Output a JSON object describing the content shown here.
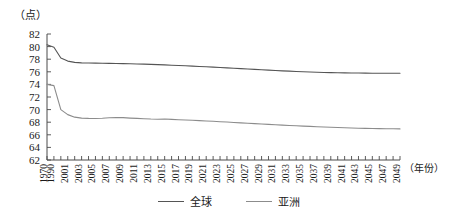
{
  "chart_data": {
    "type": "line",
    "title": "",
    "xlabel": "（年份）",
    "ylabel": "（点）",
    "ylim": [
      62,
      82
    ],
    "ytick_step": 2,
    "yticks": [
      62,
      64,
      66,
      68,
      70,
      72,
      74,
      76,
      78,
      80,
      82
    ],
    "grid": false,
    "legend_position": "bottom-center",
    "x": [
      1970,
      1990,
      2000,
      2001,
      2002,
      2003,
      2004,
      2005,
      2006,
      2007,
      2008,
      2009,
      2010,
      2011,
      2012,
      2013,
      2014,
      2015,
      2016,
      2017,
      2018,
      2019,
      2020,
      2021,
      2022,
      2023,
      2024,
      2025,
      2026,
      2027,
      2028,
      2029,
      2030,
      2031,
      2032,
      2033,
      2034,
      2035,
      2036,
      2037,
      2038,
      2039,
      2040,
      2041,
      2042,
      2043,
      2044,
      2045,
      2046,
      2047,
      2048,
      2049
    ],
    "xtick_labels": [
      "1970",
      "1990",
      "2001",
      "2003",
      "2005",
      "2007",
      "2009",
      "2011",
      "2013",
      "2015",
      "2017",
      "2019",
      "2021",
      "2023",
      "2025",
      "2027",
      "2029",
      "2031",
      "2033",
      "2035",
      "2037",
      "2039",
      "2041",
      "2043",
      "2045",
      "2047",
      "2049"
    ],
    "series": [
      {
        "name": "全球",
        "color": "#555555",
        "values": [
          80.3,
          79.9,
          78.2,
          77.7,
          77.5,
          77.42,
          77.4,
          77.38,
          77.36,
          77.34,
          77.32,
          77.3,
          77.28,
          77.25,
          77.22,
          77.18,
          77.14,
          77.1,
          77.05,
          77.0,
          76.95,
          76.9,
          76.85,
          76.8,
          76.74,
          76.68,
          76.62,
          76.56,
          76.5,
          76.44,
          76.38,
          76.32,
          76.26,
          76.2,
          76.15,
          76.1,
          76.05,
          76.0,
          75.96,
          75.93,
          75.9,
          75.87,
          75.85,
          75.83,
          75.81,
          75.8,
          75.79,
          75.78,
          75.78,
          75.77,
          75.77,
          75.77
        ]
      },
      {
        "name": "亚洲",
        "color": "#8c8c8c",
        "values": [
          74.0,
          73.8,
          70.0,
          69.2,
          68.8,
          68.65,
          68.6,
          68.58,
          68.62,
          68.7,
          68.75,
          68.72,
          68.65,
          68.6,
          68.55,
          68.5,
          68.48,
          68.5,
          68.45,
          68.4,
          68.35,
          68.3,
          68.25,
          68.2,
          68.14,
          68.08,
          68.02,
          67.96,
          67.9,
          67.84,
          67.78,
          67.72,
          67.66,
          67.6,
          67.54,
          67.48,
          67.43,
          67.38,
          67.33,
          67.28,
          67.24,
          67.2,
          67.16,
          67.12,
          67.08,
          67.05,
          67.02,
          67.0,
          66.98,
          66.96,
          66.95,
          66.94
        ]
      }
    ]
  },
  "axes": {
    "y_unit": "（点）",
    "x_unit": "（年份）"
  },
  "legend": {
    "items": [
      {
        "label": "全球",
        "color": "#555555"
      },
      {
        "label": "亚洲",
        "color": "#8c8c8c"
      }
    ]
  }
}
